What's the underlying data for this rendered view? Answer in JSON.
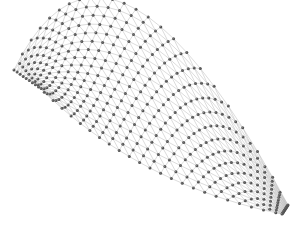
{
  "image": {
    "width": 298,
    "height": 230,
    "background": "#ffffff",
    "subject": "3D curved lattice space-frame of nodes connected by struts"
  },
  "lattice": {
    "rows": 18,
    "cols": 24,
    "node_color": "#555555",
    "node_highlight": "#9a9a9a",
    "strut_color": "#b8b8b8",
    "node_radius": 1.5,
    "strut_width": 0.5,
    "corners": {
      "top_left": [
        14,
        70
      ],
      "top_mid": [
        130,
        6
      ],
      "top_right": [
        288,
        205
      ],
      "bottom_left": [
        40,
        88
      ],
      "bottom_mid": [
        150,
        168
      ],
      "bottom_right": [
        282,
        214
      ]
    }
  }
}
